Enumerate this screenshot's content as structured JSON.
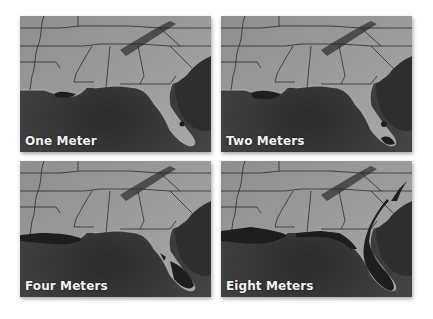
{
  "panels": [
    {
      "label": "One Meter"
    },
    {
      "label": "Two Meters"
    },
    {
      "label": "Four Meters"
    },
    {
      "label": "Eight Meters"
    }
  ],
  "colors": {
    "land": "#9a9a9a",
    "water": "#3c3c3c",
    "flooded": "#202020",
    "borders": "#1a1a1a"
  }
}
